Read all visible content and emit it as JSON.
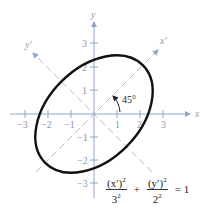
{
  "figure": {
    "axes": {
      "x_label": "x",
      "y_label": "y",
      "x_prime_label": "x′",
      "y_prime_label": "y′",
      "x_ticks": [
        "−3",
        "−2",
        "−1",
        "1",
        "2",
        "3"
      ],
      "y_ticks": [
        "3",
        "2",
        "1",
        "−1",
        "−2",
        "−3"
      ]
    },
    "rotation_angle": "45°",
    "equation": {
      "term1_num": "(x′)",
      "term1_num_exp": "2",
      "term1_den": "3",
      "term1_den_exp": "2",
      "plus": "+",
      "term2_num": "(y′)",
      "term2_num_exp": "2",
      "term2_den": "2",
      "term2_den_exp": "2",
      "equals": "= 1"
    },
    "ellipse": {
      "semi_major": 3,
      "semi_minor": 2,
      "rotation_deg": 45
    },
    "colors": {
      "axis": "#8fa6cc",
      "rotated_axis": "#b9b9c4",
      "curve": "#111111"
    }
  }
}
